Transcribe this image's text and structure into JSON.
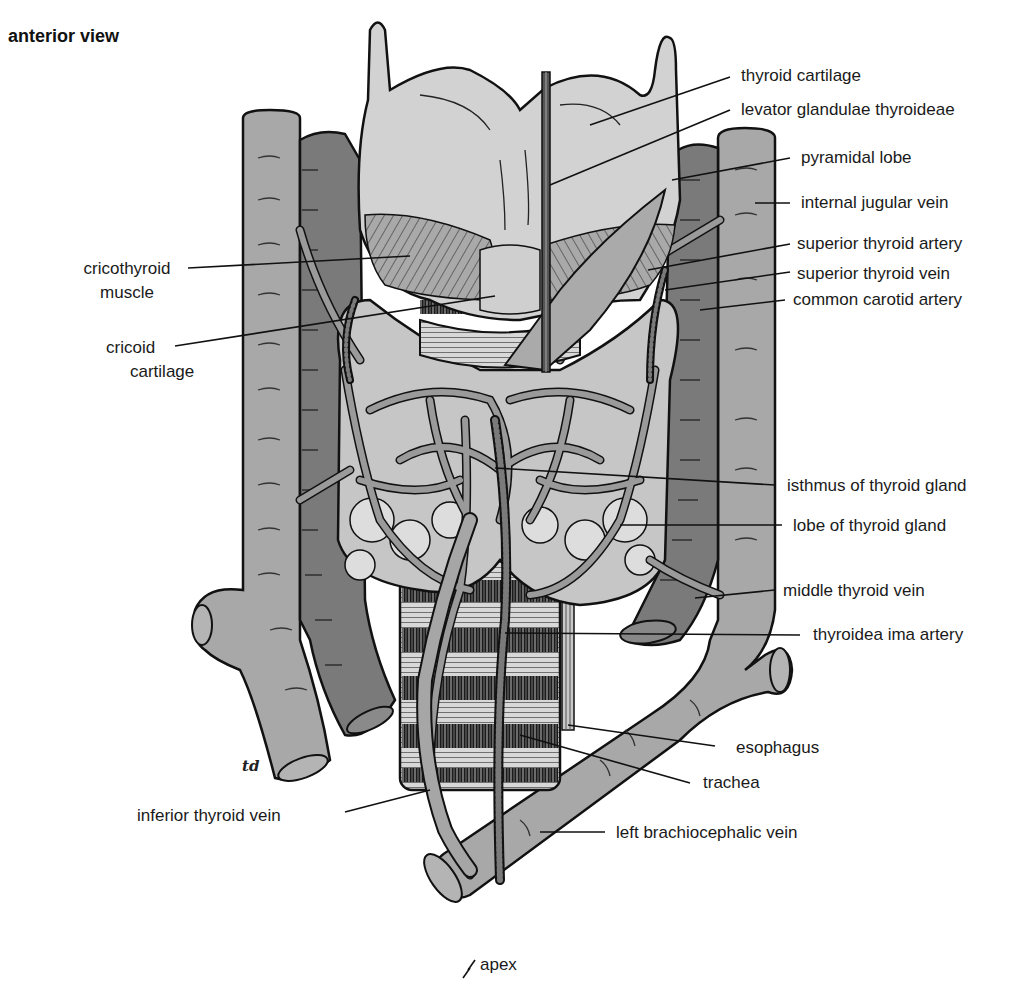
{
  "figure": {
    "title": "anterior view",
    "artist_signature": "td",
    "colors": {
      "background": "#ffffff",
      "outline": "#111111",
      "vein_light": "#a8a8a8",
      "artery_dark": "#7a7a7a",
      "cartilage": "#d2d2d2",
      "gland": "#c6c6c6",
      "vessel_network": "#9a9a9a",
      "leader_line": "#111111"
    },
    "labels_right": [
      {
        "id": "thyroid-cartilage",
        "text": "thyroid cartilage"
      },
      {
        "id": "levator-glandulae-thyroideae",
        "text": "levator glandulae thyroideae"
      },
      {
        "id": "pyramidal-lobe",
        "text": "pyramidal lobe"
      },
      {
        "id": "internal-jugular-vein",
        "text": "internal jugular vein"
      },
      {
        "id": "superior-thyroid-artery",
        "text": "superior thyroid artery"
      },
      {
        "id": "superior-thyroid-vein",
        "text": "superior thyroid vein"
      },
      {
        "id": "common-carotid-artery",
        "text": "common carotid artery"
      },
      {
        "id": "isthmus-of-thyroid-gland",
        "text": "isthmus of thyroid gland"
      },
      {
        "id": "lobe-of-thyroid-gland",
        "text": "lobe of thyroid gland"
      },
      {
        "id": "middle-thyroid-vein",
        "text": "middle thyroid vein"
      },
      {
        "id": "thyroidea-ima-artery",
        "text": "thyroidea ima artery"
      },
      {
        "id": "esophagus",
        "text": "esophagus"
      },
      {
        "id": "trachea",
        "text": "trachea"
      },
      {
        "id": "left-brachiocephalic-vein",
        "text": "left brachiocephalic vein"
      }
    ],
    "labels_left": [
      {
        "id": "cricothyroid-muscle",
        "line1": "cricothyroid",
        "line2": "muscle"
      },
      {
        "id": "cricoid-cartilage",
        "line1": "cricoid",
        "line2": "cartilage"
      },
      {
        "id": "inferior-thyroid-vein",
        "text": "inferior thyroid vein"
      }
    ],
    "labels_bottom": [
      {
        "id": "apex",
        "text": "apex"
      }
    ]
  }
}
